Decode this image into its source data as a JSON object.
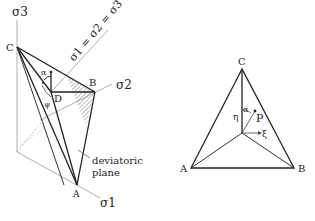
{
  "left_figure": {
    "axes": {
      "sigma3": "σ3",
      "sigma2": "σ2",
      "sigma1": "σ1"
    },
    "hydrostatic_axis_label": "σ1 = σ2 = σ3",
    "points": {
      "A": "A",
      "B": "B",
      "C": "C",
      "D": "D"
    },
    "angles": {
      "alpha": "α",
      "psi": "ψ"
    },
    "annotation": {
      "line1": "deviatoric",
      "line2": "plane"
    }
  },
  "right_figure": {
    "points": {
      "A": "A",
      "B": "B",
      "C": "C",
      "P": "P"
    },
    "angle_alpha": "α",
    "eta_axis": "η",
    "xi_axis": "ξ"
  }
}
